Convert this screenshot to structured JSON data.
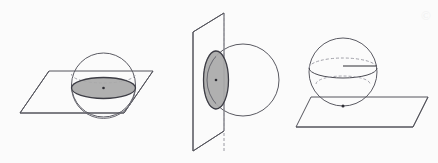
{
  "canvas": {
    "width": 438,
    "height": 163,
    "background_color": "#fbfbfb",
    "watermark_text": "©"
  },
  "style": {
    "stroke_color": "#4a4a52",
    "stroke_color_light": "#8a8a92",
    "plane_stroke_color": "#55555d",
    "disk_fill_color": "#a9a9a9",
    "disk_stroke_color": "#3d3d45",
    "center_dot_color": "#2e2e34",
    "dashed_color": "#9a9aa2",
    "stroke_width": 1,
    "dash_pattern": "3,2"
  },
  "figures": [
    {
      "id": "figure-1",
      "name": "sphere-cut-by-horizontal-plane",
      "caption": "Horizontal plane cutting sphere through its center — cross section is a great circle disk",
      "sphere": {
        "cx": 103.5,
        "cy": 85,
        "r": 32
      },
      "plane": {
        "orientation": "horizontal",
        "points": "20,113 49,71 153,71 124,113"
      },
      "cross_section": {
        "shape": "ellipse",
        "cx": 103.5,
        "cy": 88,
        "rx": 32,
        "ry": 10.5,
        "filled": true
      },
      "hidden_arc": {
        "type": "dashed-ellipse-top",
        "cx": 103.5,
        "cy": 74,
        "rx": 32,
        "ry": 9
      },
      "center_dot": {
        "cx": 103.5,
        "cy": 88,
        "r": 1.2
      }
    },
    {
      "id": "figure-2",
      "name": "sphere-cut-by-vertical-plane",
      "caption": "Vertical plane cutting sphere off-center — cross section is a smaller circle disk",
      "sphere": {
        "cx": 243,
        "cy": 80,
        "r": 36
      },
      "plane": {
        "orientation": "vertical",
        "points": "193,32 224,13 224,131 193,151"
      },
      "cross_section": {
        "shape": "ellipse",
        "cx": 216,
        "cy": 80,
        "rx": 12.5,
        "ry": 29,
        "filled": true
      },
      "hidden_arc": {
        "type": "dashed-ellipse-left",
        "cx": 216,
        "cy": 80,
        "rx": 12.5,
        "ry": 29
      },
      "plane_fold_line": {
        "x1": 224,
        "y1": 13,
        "x2": 224,
        "y2": 151
      },
      "center_dot": {
        "cx": 216,
        "cy": 80,
        "r": 1.2
      }
    },
    {
      "id": "figure-3",
      "name": "sphere-tangent-to-plane",
      "caption": "Plane tangent to sphere at a single point",
      "sphere": {
        "cx": 343,
        "cy": 72,
        "r": 34
      },
      "plane": {
        "orientation": "horizontal",
        "points": "296,127 311,97 428,97 413,127"
      },
      "equator": {
        "type": "solid-front-arc-dashed-back",
        "cx": 343,
        "cy": 68,
        "rx": 34,
        "ry": 10
      },
      "lower_latitude": {
        "type": "dashed-ellipse",
        "cx": 343,
        "cy": 84,
        "rx": 27,
        "ry": 8
      },
      "radius_line": {
        "x1": 343,
        "y1": 66,
        "x2": 377,
        "y2": 66
      },
      "tangent_dot": {
        "cx": 343,
        "cy": 106,
        "r": 1.4
      }
    }
  ]
}
